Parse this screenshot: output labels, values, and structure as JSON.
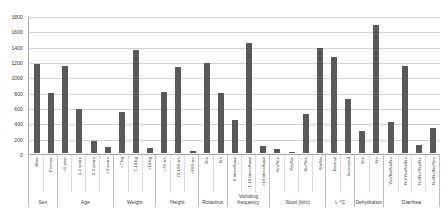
{
  "chart_data": {
    "type": "bar",
    "title": "",
    "subtitle": "",
    "xlabel": "",
    "ylabel": "",
    "ylim": [
      0,
      1800
    ],
    "ytick_step": 200,
    "grid": true,
    "legend": "none",
    "bar_color": "#595959",
    "gridline_color": "#d0d0d0",
    "axis_color": "#a6a6a6",
    "yticks": [
      "0",
      "200",
      "400",
      "600",
      "800",
      "1000",
      "1200",
      "1400",
      "1600",
      "1800"
    ],
    "categories": [
      "Male",
      "Female",
      "<1 year",
      "1-2 years",
      "2-3 years",
      ">3 years",
      "<7 kg",
      "7-14 kg",
      ">14 kg",
      "<70 sm",
      "70-100 sm",
      ">100 sm",
      "Yes",
      "No",
      "0 times/hour",
      "1-10 times/hour",
      ">10 times/hour",
      "Yes/Yes",
      "Yes/No",
      "No/Yes",
      "No/No",
      "Normal",
      "Increased",
      "Yes",
      "No",
      "Yes/No/No/No",
      "No/Yes/No/No",
      "No/No/Yes/No",
      "No/No/No/Yes"
    ],
    "values": [
      1170,
      790,
      1140,
      580,
      155,
      75,
      540,
      1350,
      60,
      800,
      1130,
      25,
      1180,
      790,
      430,
      1450,
      95,
      50,
      15,
      515,
      1385,
      1260,
      710,
      295,
      1685,
      410,
      1140,
      100,
      330
    ],
    "groups": [
      {
        "label": "Sex",
        "count": 2
      },
      {
        "label": "Age",
        "count": 4
      },
      {
        "label": "Weight",
        "count": 3
      },
      {
        "label": "Height",
        "count": 3
      },
      {
        "label": "Rotavirus",
        "count": 2
      },
      {
        "label": "Vomiting frequency",
        "count": 3
      },
      {
        "label": "Stool (b/m)",
        "count": 4
      },
      {
        "label": "t, °C",
        "count": 2
      },
      {
        "label": "Dehydration",
        "count": 2
      },
      {
        "label": "Diarrhea",
        "count": 4
      }
    ]
  }
}
